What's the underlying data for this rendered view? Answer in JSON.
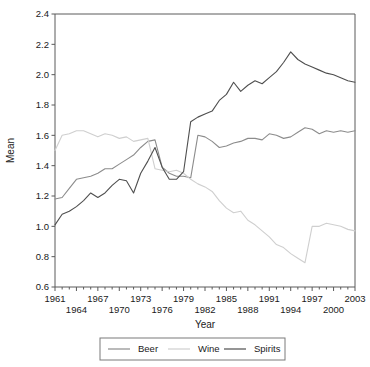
{
  "chart_data": {
    "type": "line",
    "title": "",
    "xlabel": "Year",
    "ylabel": "Mean",
    "xlim": [
      1961,
      2003
    ],
    "ylim": [
      0.6,
      2.4
    ],
    "grid": false,
    "legend_position": "bottom",
    "y_ticks": [
      "2.4",
      "2.2",
      "2.0",
      "1.8",
      "1.6",
      "1.4",
      "1.2",
      "1.0",
      "0.8",
      "0.6"
    ],
    "y_tick_values": [
      2.4,
      2.2,
      2.0,
      1.8,
      1.6,
      1.4,
      1.2,
      1.0,
      0.8,
      0.6
    ],
    "x_ticks_upper": [
      "1961",
      "1967",
      "1973",
      "1979",
      "1985",
      "1991",
      "1997",
      "2003"
    ],
    "x_ticks_upper_values": [
      1961,
      1967,
      1973,
      1979,
      1985,
      1991,
      1997,
      2003
    ],
    "x_ticks_lower": [
      "1964",
      "1970",
      "1976",
      "1982",
      "1988",
      "1994",
      "2000"
    ],
    "x_ticks_lower_values": [
      1964,
      1970,
      1976,
      1982,
      1988,
      1994,
      2000
    ],
    "x": [
      1961,
      1962,
      1963,
      1964,
      1965,
      1966,
      1967,
      1968,
      1969,
      1970,
      1971,
      1972,
      1973,
      1974,
      1975,
      1976,
      1977,
      1978,
      1979,
      1980,
      1981,
      1982,
      1983,
      1984,
      1985,
      1986,
      1987,
      1988,
      1989,
      1990,
      1991,
      1992,
      1993,
      1994,
      1995,
      1996,
      1997,
      1998,
      1999,
      2000,
      2001,
      2002,
      2003
    ],
    "series": [
      {
        "name": "Beer",
        "color": "#8c8c8c",
        "values": [
          1.18,
          1.19,
          1.25,
          1.31,
          1.32,
          1.33,
          1.35,
          1.38,
          1.38,
          1.41,
          1.44,
          1.47,
          1.52,
          1.56,
          1.57,
          1.39,
          1.35,
          1.33,
          1.33,
          1.32,
          1.6,
          1.59,
          1.56,
          1.52,
          1.53,
          1.55,
          1.56,
          1.58,
          1.58,
          1.57,
          1.61,
          1.6,
          1.58,
          1.59,
          1.62,
          1.65,
          1.64,
          1.61,
          1.63,
          1.62,
          1.63,
          1.62,
          1.63
        ]
      },
      {
        "name": "Wine",
        "color": "#cfcfcf",
        "values": [
          1.5,
          1.6,
          1.61,
          1.63,
          1.63,
          1.61,
          1.59,
          1.61,
          1.6,
          1.58,
          1.59,
          1.56,
          1.57,
          1.58,
          1.38,
          1.37,
          1.36,
          1.37,
          1.35,
          1.31,
          1.28,
          1.26,
          1.23,
          1.17,
          1.12,
          1.09,
          1.1,
          1.04,
          1.01,
          0.97,
          0.93,
          0.88,
          0.86,
          0.82,
          0.79,
          0.76,
          1.0,
          1.0,
          1.02,
          1.01,
          1.0,
          0.98,
          0.97
        ]
      },
      {
        "name": "Spirits",
        "color": "#4f4f4f",
        "values": [
          1.01,
          1.08,
          1.1,
          1.13,
          1.17,
          1.22,
          1.19,
          1.22,
          1.27,
          1.31,
          1.3,
          1.22,
          1.35,
          1.43,
          1.52,
          1.39,
          1.31,
          1.31,
          1.36,
          1.69,
          1.72,
          1.74,
          1.76,
          1.83,
          1.87,
          1.95,
          1.89,
          1.93,
          1.96,
          1.94,
          1.98,
          2.02,
          2.08,
          2.15,
          2.1,
          2.07,
          2.05,
          2.03,
          2.01,
          2.0,
          1.98,
          1.96,
          1.95
        ]
      }
    ]
  },
  "legend": {
    "entries": [
      {
        "label": "Beer",
        "color": "#8c8c8c"
      },
      {
        "label": "Wine",
        "color": "#cfcfcf"
      },
      {
        "label": "Spirits",
        "color": "#4f4f4f"
      }
    ]
  }
}
